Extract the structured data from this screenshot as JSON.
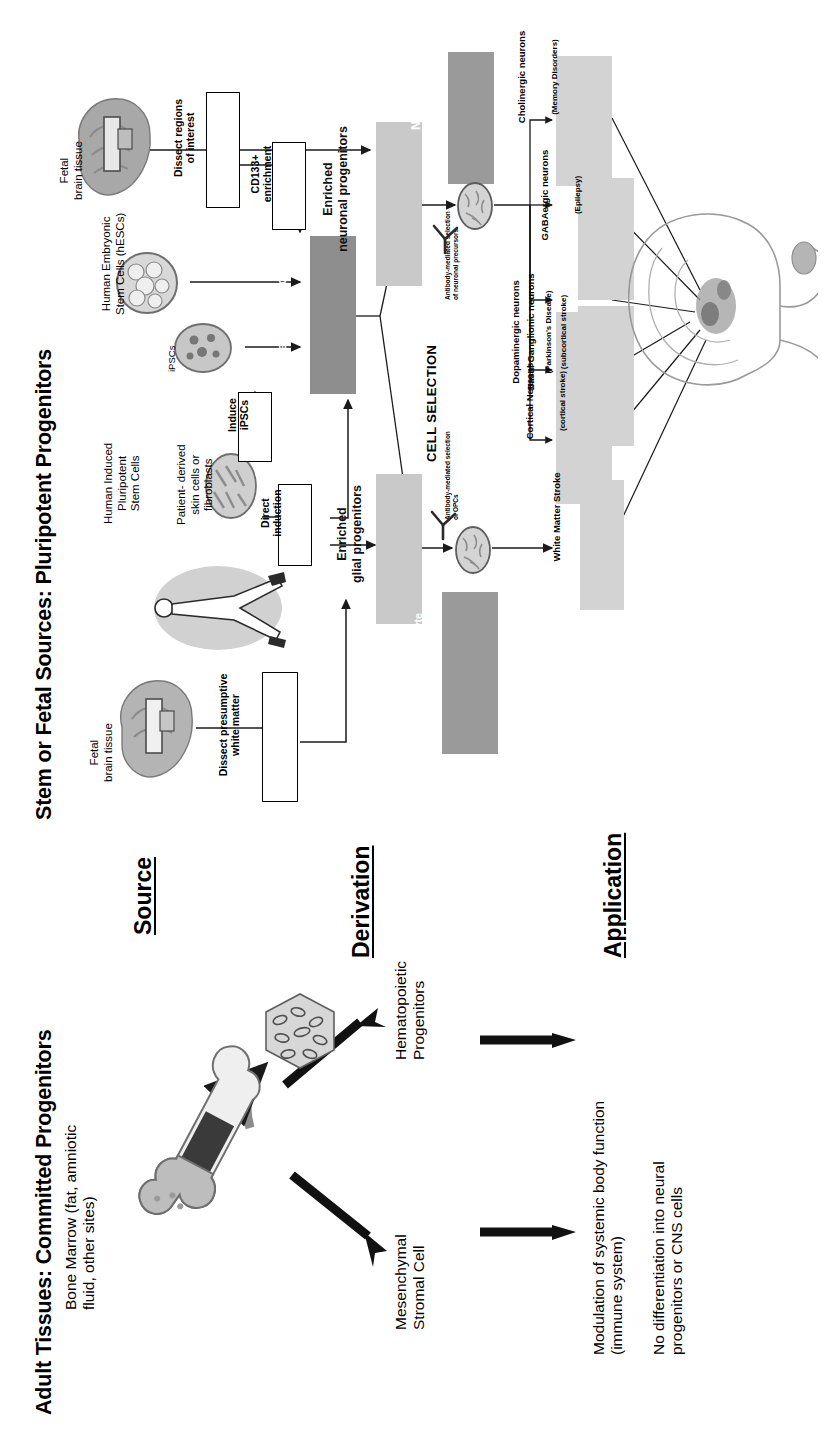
{
  "figure": {
    "top_title": "Stem or Fetal Sources: Pluripotent Progenitors",
    "bottom_title": "Adult Tissues: Committed Progenitors"
  },
  "sections": {
    "source": "Source",
    "derivation": "Derivation",
    "application": "Application"
  },
  "sources": {
    "fetal_brain_top": "Fetal\nbrain tissue",
    "hescs": "Human Embryonic\nStem Cells (hESCs)",
    "hipsc": "Human Induced\nPluripotent\nStem Cells",
    "ipscs_label": "iPSCs",
    "fibroblasts": "Patient- derived\nskin cells or\nfibroblasts",
    "fetal_brain_bottom": "Fetal\nbrain tissue"
  },
  "process": {
    "dissect_regions": "Dissect regions\nof interest",
    "cd133": "CD133+\nenrichment",
    "induce_ipscs": "Induce\niPSCs",
    "direct_induction": "Direct\ninduction",
    "dissect_white_matter": "Dissect presumptive\nwhite matter"
  },
  "derivation": {
    "neural_stem_cells": "Neural stem cells",
    "enriched_neuronal": "Enriched\nneuronal progenitors",
    "enriched_glial": "Enriched\nglial progenitors",
    "neuronal_progenitor_cells": "Neuronal\nprogenitor cells",
    "astro_oligo": "Astrocyte-\noligodendrocyte\nglial progenitor cells"
  },
  "cell_selection": {
    "heading": "CELL SELECTION",
    "neuronal_note": "Antibody-mediated selection\nof neuronal precursors",
    "glial_note": "Antibody-mediated selection\nof OPCs"
  },
  "applications": [
    {
      "name": "Cholinergic neurons",
      "indication": "(Memory Disorders)"
    },
    {
      "name": "GABAergic neurons",
      "indication": "(Epilepsy)"
    },
    {
      "name": "Dopaminergic neurons",
      "indication": "(Parkinson's Disease)"
    },
    {
      "name": "Basal Ganglionic neurons",
      "indication": "(subcortical stroke)"
    },
    {
      "name": "Cortical Neurons",
      "indication": "(cortical stroke)"
    },
    {
      "name": "White Matter Stroke",
      "indication": ""
    }
  ],
  "adult": {
    "bone_marrow": "Bone Marrow (fat, amniotic\nfluid, other sites)",
    "hematopoietic": "Hematopoietic\nProgenitors",
    "mesenchymal": "Mesenchymal\nStromal Cell",
    "outcome_immune": "Modulation of systemic body function\n(immune system)",
    "outcome_no_diff": "No differentiation into neural\nprogenitors or CNS cells"
  },
  "colors": {
    "box_light_gray": "#c9c9c9",
    "box_dark_gray": "#8e8e8e",
    "app_gray": "#d3d3d3",
    "line": "#1a1a1a"
  }
}
